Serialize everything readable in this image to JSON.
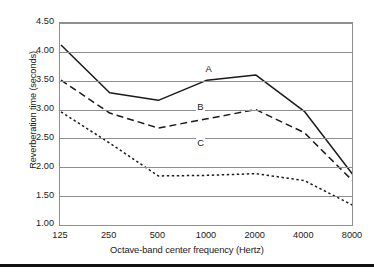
{
  "chart_data": {
    "type": "line",
    "title": "",
    "xlabel": "Octave-band center frequency (Hertz)",
    "ylabel": "Reverberation time (seconds)",
    "categories": [
      "125",
      "250",
      "500",
      "1000",
      "2000",
      "4000",
      "8000"
    ],
    "x_tick_labels": [
      "125",
      "250",
      "500",
      "1000",
      "2000",
      "4000",
      "8000"
    ],
    "y_tick_labels": [
      "4.50",
      "4.00",
      "3.50",
      "3.00",
      "2.50",
      "2.00",
      "1.50",
      "1.00"
    ],
    "y_tick_values": [
      4.5,
      4.0,
      3.5,
      3.0,
      2.5,
      2.0,
      1.5,
      1.0
    ],
    "ylim": [
      1.0,
      4.5
    ],
    "grid": "horizontal",
    "legend": "inline-labels",
    "series": [
      {
        "name": "A",
        "style": "solid",
        "color": "#1a1a1a",
        "values": [
          4.12,
          3.29,
          3.16,
          3.51,
          3.6,
          2.97,
          1.87
        ]
      },
      {
        "name": "B",
        "style": "dashed",
        "color": "#1a1a1a",
        "values": [
          3.51,
          2.94,
          2.68,
          2.84,
          3.0,
          2.6,
          1.76
        ]
      },
      {
        "name": "C",
        "style": "dotted",
        "color": "#1a1a1a",
        "values": [
          2.96,
          2.42,
          1.85,
          1.86,
          1.89,
          1.77,
          1.34
        ]
      }
    ],
    "annotations": [
      {
        "text": "A",
        "series": "A",
        "x_frac": 0.503,
        "y_value": 3.7
      },
      {
        "text": "B",
        "series": "B",
        "x_frac": 0.475,
        "y_value": 3.05
      },
      {
        "text": "C",
        "series": "C",
        "x_frac": 0.475,
        "y_value": 2.42
      }
    ]
  },
  "colors": {
    "grid": "#8e8e8e",
    "frame": "#8e8e8e",
    "ink": "#1a1a1a",
    "rule": "#111111",
    "background": "#ffffff"
  }
}
